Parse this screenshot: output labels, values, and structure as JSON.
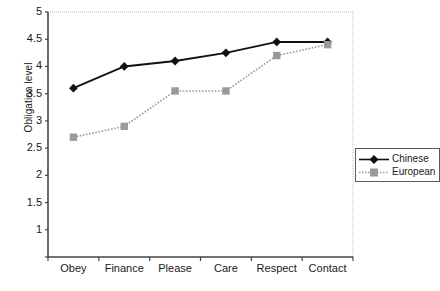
{
  "chart_data": {
    "type": "line",
    "title": "",
    "xlabel": "",
    "ylabel": "Obligation level",
    "categories": [
      "Obey",
      "Finance",
      "Please",
      "Care",
      "Respect",
      "Contact"
    ],
    "ylim": [
      0.5,
      5
    ],
    "ytick_labels": [
      "5",
      "4.5",
      "4",
      "3.5",
      "3",
      "2.5",
      "2",
      "1.5",
      "1"
    ],
    "ytick_values": [
      5,
      4.5,
      4,
      3.5,
      3,
      2.5,
      2,
      1.5,
      1
    ],
    "grid": false,
    "legend_position": "right",
    "series": [
      {
        "name": "Chinese",
        "values": [
          3.6,
          4.0,
          4.1,
          4.25,
          4.45,
          4.45
        ],
        "color": "#111111",
        "marker": "diamond",
        "linestyle": "solid"
      },
      {
        "name": "European",
        "values": [
          2.7,
          2.9,
          3.55,
          3.55,
          4.2,
          4.4
        ],
        "color": "#9a9a9a",
        "marker": "square",
        "linestyle": "dotted"
      }
    ]
  },
  "legend": {
    "entries": [
      {
        "label": "Chinese"
      },
      {
        "label": "European"
      }
    ]
  },
  "axes": {
    "y_title": "Obligation level"
  },
  "colors": {
    "chinese": "#111111",
    "european": "#9a9a9a",
    "axis": "#444444",
    "plot_border": "#b4b4b4",
    "background": "#ffffff"
  }
}
